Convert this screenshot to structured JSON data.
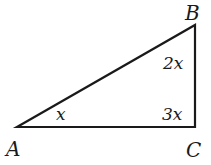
{
  "diagram": {
    "type": "right-triangle",
    "vertices": {
      "A": {
        "label": "A"
      },
      "B": {
        "label": "B"
      },
      "C": {
        "label": "C"
      }
    },
    "angles": {
      "A": {
        "label": "x"
      },
      "B": {
        "label": "2x"
      },
      "C": {
        "label": "3x"
      }
    },
    "colors": {
      "stroke": "#1a1a1a",
      "background": "#ffffff"
    }
  }
}
